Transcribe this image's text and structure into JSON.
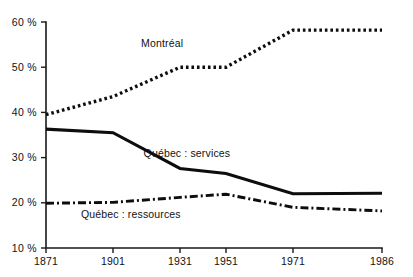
{
  "caption": {
    "partial_text_top_clipped": ""
  },
  "chart_data": {
    "type": "line",
    "title": "",
    "subtitle": "",
    "xlabel": "",
    "ylabel": "",
    "x": [
      1871,
      1901,
      1931,
      1951,
      1971,
      1986
    ],
    "categories": [
      "1871",
      "1901",
      "1931",
      "1951",
      "1971",
      "1986"
    ],
    "xtick_labels": [
      "1871",
      "1901",
      "1931",
      "1951",
      "1971",
      "1986"
    ],
    "ytick_labels": [
      "60 %",
      "50 %",
      "40 %",
      "30 %",
      "20 %",
      "10 %"
    ],
    "ytick_values": [
      60,
      50,
      40,
      30,
      20,
      10
    ],
    "ylim": [
      10,
      60
    ],
    "xlim": [
      1871,
      1986
    ],
    "grid": false,
    "legend_position": "inline-annotations",
    "yaxis_unit": "%",
    "series": [
      {
        "name": "Montréal",
        "style": "dotted",
        "color": "#0d0d0d",
        "label": "Montréal",
        "x": [
          1871,
          1901,
          1931,
          1951,
          1971,
          1986
        ],
        "values": [
          39.5,
          43.5,
          50.0,
          50.0,
          58.2,
          58.2
        ]
      },
      {
        "name": "Québec : services",
        "style": "solid",
        "color": "#0d0d0d",
        "label": "Québec : services",
        "x": [
          1871,
          1901,
          1931,
          1951,
          1971,
          1986
        ],
        "values": [
          36.3,
          35.5,
          27.6,
          26.5,
          22.0,
          22.1
        ]
      },
      {
        "name": "Québec : ressources",
        "style": "dash-dot",
        "color": "#0d0d0d",
        "label": "Québec : ressources",
        "x": [
          1871,
          1901,
          1931,
          1951,
          1971,
          1986
        ],
        "values": [
          19.9,
          20.1,
          21.2,
          21.9,
          19.0,
          18.2
        ]
      }
    ],
    "annotations": [
      {
        "text": "Montréal",
        "x": 1923,
        "y": 54.5
      },
      {
        "text": "Québec : services",
        "x": 1934,
        "y": 30.2
      },
      {
        "text": "Québec : ressources",
        "x": 1909,
        "y": 16.6
      }
    ]
  },
  "axes": {
    "y_labels": [
      "60 %",
      "50 %",
      "40 %",
      "30 %",
      "20 %",
      "10 %"
    ],
    "x_labels": [
      "1871",
      "1901",
      "1931",
      "1951",
      "1971",
      "1986"
    ]
  },
  "colors": {
    "ink": "#0d0d0d",
    "axis": "#1a1a1a",
    "background": "#ffffff"
  }
}
